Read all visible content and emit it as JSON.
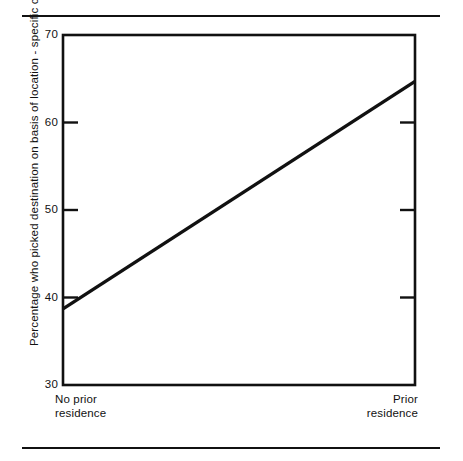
{
  "figure": {
    "background": "#ffffff",
    "ink_color": "#111111",
    "rules": {
      "top": "horizontal-rule-top",
      "bottom": "horizontal-rule-bottom"
    }
  },
  "chart_data": {
    "type": "line",
    "title": "",
    "xlabel": "",
    "ylabel": "Percentage who picked destination on basis of location - specific capital",
    "categories": [
      "No prior residence",
      "Prior residence"
    ],
    "x_tick_labels": [
      "No prior\nresidence",
      "Prior\nresidence"
    ],
    "x_tick_label_left_line1": "No prior",
    "x_tick_label_left_line2": "residence",
    "x_tick_label_right_line1": "Prior",
    "x_tick_label_right_line2": "residence",
    "series": [
      {
        "name": "Percentage who picked destination on basis of location-specific capital",
        "values": [
          38.7,
          64.7
        ],
        "color": "#111111",
        "line_width": 3
      }
    ],
    "ylim": [
      30,
      70
    ],
    "y_ticks": [
      30,
      40,
      50,
      60,
      70
    ],
    "y_tick_labels": [
      "30",
      "40",
      "50",
      "60",
      "70"
    ],
    "grid": false,
    "legend": false,
    "frame": "full-box",
    "left_axis_ticks_direction": "outward-at-40-50-60",
    "right_axis_ticks_direction": "inward-at-40-50-60"
  },
  "axis": {
    "y_tick_30": "30",
    "y_tick_40": "40",
    "y_tick_50": "50",
    "y_tick_60": "60",
    "y_tick_70": "70"
  }
}
